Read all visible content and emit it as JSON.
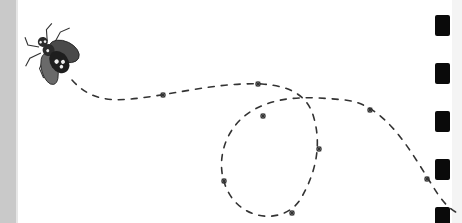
{
  "illustration": {
    "subject": "bee-flight-path",
    "background": "#ffffff",
    "left_strip_color": "#c9c9c9",
    "path_color": "#333333",
    "bee_colors": {
      "body": "#2a2a2a",
      "wing": "#555555",
      "spot": "#eeeeee"
    },
    "flight_path": "M72,80 C90,100 110,102 140,98 C175,94 220,82 262,84 C290,86 305,95 312,112 C322,140 318,170 300,200 C285,222 250,222 232,198 C212,170 222,130 250,112 C275,96 305,96 345,100 C385,104 410,150 432,185 C440,198 448,210 462,215",
    "stars": [
      {
        "x": 163,
        "y": 95
      },
      {
        "x": 258,
        "y": 84
      },
      {
        "x": 263,
        "y": 116
      },
      {
        "x": 370,
        "y": 110
      },
      {
        "x": 319,
        "y": 149
      },
      {
        "x": 224,
        "y": 181
      },
      {
        "x": 292,
        "y": 213
      },
      {
        "x": 427,
        "y": 179
      }
    ],
    "perforations": [
      {
        "x": 435,
        "y": 15
      },
      {
        "x": 435,
        "y": 63
      },
      {
        "x": 435,
        "y": 111
      },
      {
        "x": 435,
        "y": 159
      },
      {
        "x": 435,
        "y": 207
      }
    ]
  }
}
